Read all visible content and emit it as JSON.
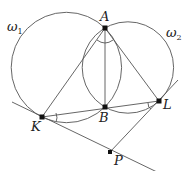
{
  "diagram": {
    "colors": {
      "stroke": "#555555",
      "point": "#111111",
      "background": "#ffffff"
    },
    "circles": [
      {
        "name": "omega1",
        "label": "ω",
        "sub": "1",
        "cx": 66.4,
        "cy": 67.5,
        "r": 55.2
      },
      {
        "name": "omega2",
        "label": "ω",
        "sub": "2",
        "cx": 127.9,
        "cy": 67.5,
        "r": 45.7
      }
    ],
    "points": {
      "A": {
        "label": "A",
        "x": 105,
        "y": 28
      },
      "B": {
        "label": "B",
        "x": 105,
        "y": 107
      },
      "K": {
        "label": "K",
        "x": 42,
        "y": 117
      },
      "L": {
        "label": "L",
        "x": 159,
        "y": 101
      },
      "P": {
        "label": "P",
        "x": 110,
        "y": 152
      }
    },
    "labels": {
      "A": "A",
      "B": "B",
      "K": "K",
      "L": "L",
      "P": "P",
      "omega1": "ω",
      "omega1_sub": "1",
      "omega2": "ω",
      "omega2_sub": "2"
    }
  }
}
